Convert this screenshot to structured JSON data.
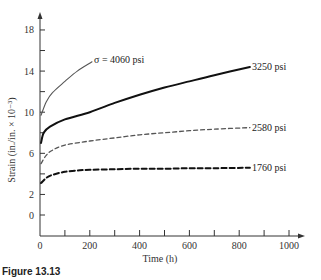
{
  "chart_data": {
    "type": "line",
    "title": "",
    "xlabel": "Time (h)",
    "ylabel": "Strain (in./in. × 10⁻³)",
    "xlim": [
      0,
      1050
    ],
    "ylim": [
      -2,
      19
    ],
    "x_ticks": [
      0,
      200,
      400,
      600,
      800,
      1000
    ],
    "x_minor_ticks": [
      100,
      300,
      500,
      700,
      900
    ],
    "y_ticks": [
      0,
      2,
      6,
      10,
      14,
      18
    ],
    "y_minor_ticks": [
      4,
      8,
      12,
      16
    ],
    "grid": false,
    "legend": "inline labels at curve ends",
    "series": [
      {
        "name": "σ = 4060 psi",
        "style": "solid-thin",
        "x": [
          4,
          25,
          50,
          100,
          150,
          209
        ],
        "y": [
          9.7,
          11.0,
          11.9,
          13.0,
          14.0,
          14.9
        ]
      },
      {
        "name": "3250 psi",
        "style": "solid-thick",
        "x": [
          4,
          15,
          40,
          100,
          200,
          300,
          400,
          500,
          600,
          700,
          843
        ],
        "y": [
          7.0,
          8.0,
          8.6,
          9.3,
          10.0,
          10.9,
          11.7,
          12.4,
          13.0,
          13.6,
          14.4
        ]
      },
      {
        "name": "2580 psi",
        "style": "dashed-thin",
        "x": [
          4,
          25,
          50,
          100,
          200,
          300,
          400,
          500,
          600,
          700,
          843
        ],
        "y": [
          5.0,
          5.8,
          6.3,
          6.8,
          7.2,
          7.5,
          7.8,
          8.0,
          8.2,
          8.35,
          8.5
        ]
      },
      {
        "name": "1760 psi",
        "style": "dashed-thick",
        "x": [
          4,
          25,
          50,
          100,
          160,
          200,
          300,
          400,
          500,
          600,
          700,
          843
        ],
        "y": [
          3.1,
          3.6,
          3.9,
          4.2,
          4.35,
          4.4,
          4.45,
          4.5,
          4.5,
          4.55,
          4.55,
          4.6
        ]
      }
    ],
    "annotations": [
      "σ = 4060 psi",
      "3250 psi",
      "2580 psi",
      "1760 psi"
    ]
  },
  "labels": {
    "xlabel": "Time (h)",
    "ylabel": "Strain (in./in. × 10⁻³)",
    "series_4060": "σ = 4060 psi",
    "series_3250": "3250 psi",
    "series_2580": "2580 psi",
    "series_1760": "1760 psi",
    "caption": "Figure 13.13"
  }
}
